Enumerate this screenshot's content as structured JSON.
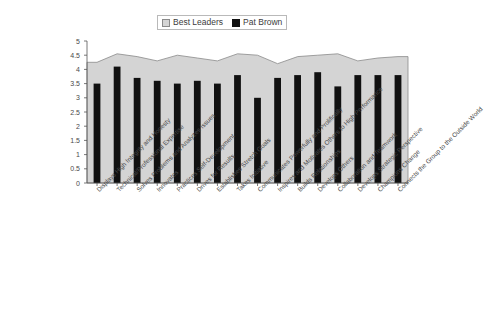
{
  "legend": {
    "position": "top-center",
    "items": [
      {
        "label": "Best Leaders",
        "swatch": "area-swatch",
        "color": "#d4d4d4"
      },
      {
        "label": "Pat Brown",
        "swatch": "bar-swatch",
        "color": "#111111"
      }
    ]
  },
  "axis": {
    "y_ticks": [
      "5",
      "4.5",
      "4",
      "3.5",
      "3",
      "2.5",
      "2",
      "1.5",
      "1",
      "0.5",
      "0"
    ]
  },
  "chart_data": {
    "type": "bar",
    "title": "",
    "subtitle": "",
    "xlabel": "",
    "ylabel": "",
    "ylim": [
      0,
      5
    ],
    "ytick_step": 0.5,
    "grid": false,
    "legend_position": "top-center",
    "categories": [
      "Displays High Integrity and Honesty",
      "Technical/Professional Expertise",
      "Solves Problems and Analyzes Issues",
      "Innovates",
      "Practices Self-Development",
      "Drives for Results",
      "Establishes Stretch Goals",
      "Takes Initiative",
      "Communicates Powerfully and Prolifically",
      "Inspires and Motivates Others to High Performance",
      "Builds Relationships",
      "Develops Others",
      "Collaboration and Teamwork",
      "Develops Strategic Perspective",
      "Champions Change",
      "Connects the Group to the Outside World"
    ],
    "series": [
      {
        "name": "Best Leaders",
        "render": "area",
        "color": "#d4d4d4",
        "edge_color": "#8a8a8a",
        "values": [
          4.25,
          4.55,
          4.45,
          4.3,
          4.5,
          4.4,
          4.3,
          4.55,
          4.5,
          4.2,
          4.45,
          4.5,
          4.55,
          4.3,
          4.4,
          4.45
        ]
      },
      {
        "name": "Pat Brown",
        "render": "bar",
        "color": "#111111",
        "values": [
          3.5,
          4.1,
          3.7,
          3.6,
          3.5,
          3.6,
          3.5,
          3.8,
          3.0,
          3.7,
          3.8,
          3.9,
          3.4,
          3.8,
          3.8,
          3.8
        ]
      }
    ]
  }
}
